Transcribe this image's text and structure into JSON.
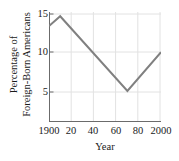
{
  "chart_data": {
    "type": "line",
    "title": "",
    "xlabel": "Year",
    "ylabel": "Percentage of Foreign-Born Americans",
    "ylabel_lines": [
      "Percentage of",
      "Foreign-Born Americans"
    ],
    "xlim": [
      1900,
      2000
    ],
    "ylim": [
      0,
      15.6
    ],
    "xticks": [
      1900,
      1920,
      1940,
      1960,
      1980,
      2000
    ],
    "xtick_labels": [
      "1900",
      "20",
      "40",
      "60",
      "80",
      "2000"
    ],
    "yticks": [
      5,
      10,
      15
    ],
    "ytick_labels": [
      "5",
      "10",
      "15"
    ],
    "grid": true,
    "legend": "none",
    "line_color": "#808080",
    "grid_color": "#e2e2e2",
    "axis_color": "#6b6b6b",
    "series": [
      {
        "name": "Percentage of Foreign-Born Americans",
        "x": [
          1900,
          1910,
          1970,
          2000
        ],
        "values": [
          13.6,
          15.0,
          4.4,
          9.9
        ]
      }
    ]
  }
}
